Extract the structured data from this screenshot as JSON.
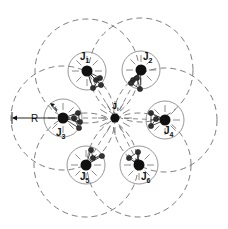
{
  "diagram": {
    "center": {
      "label": "J",
      "sub": "i",
      "x": 115,
      "y": 118
    },
    "nodes": [
      {
        "label": "J",
        "sub": "1",
        "x": 87,
        "y": 71,
        "lx": 80,
        "ly": 60,
        "sats": [
          [
            96,
            80
          ],
          [
            100,
            78
          ],
          [
            93,
            88
          ],
          [
            101,
            85
          ]
        ]
      },
      {
        "label": "J",
        "sub": "2",
        "x": 141,
        "y": 70,
        "lx": 143,
        "ly": 60,
        "sats": [
          [
            133,
            80
          ],
          [
            137,
            78
          ],
          [
            140,
            89
          ],
          [
            131,
            83
          ]
        ]
      },
      {
        "label": "J",
        "sub": "3",
        "x": 63,
        "y": 118,
        "lx": 56,
        "ly": 136,
        "sats": [
          [
            78,
            113
          ],
          [
            80,
            122
          ],
          [
            74,
            118
          ],
          [
            79,
            128
          ]
        ]
      },
      {
        "label": "J",
        "sub": "4",
        "x": 165,
        "y": 120,
        "lx": 164,
        "ly": 134,
        "sats": [
          [
            151,
            113
          ],
          [
            151,
            126
          ],
          [
            156,
            119
          ]
        ]
      },
      {
        "label": "J",
        "sub": "5",
        "x": 86,
        "y": 165,
        "lx": 80,
        "ly": 180,
        "sats": [
          [
            91,
            150
          ],
          [
            93,
            158
          ],
          [
            102,
            156
          ]
        ]
      },
      {
        "label": "J",
        "sub": "6",
        "x": 139,
        "y": 165,
        "lx": 141,
        "ly": 180,
        "sats": [
          [
            129,
            158
          ],
          [
            138,
            152
          ],
          [
            137,
            162
          ]
        ]
      }
    ],
    "small_radius": 19,
    "large_radius": 52,
    "R_label": "R",
    "r_label": "r",
    "colors": {
      "ink": "#111111",
      "dash": "#6e6e6e",
      "circle": "#8a8a8a"
    }
  }
}
